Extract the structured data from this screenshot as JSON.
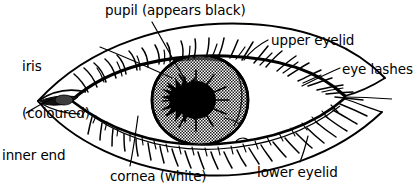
{
  "diagram": {
    "subject": "eye",
    "style": "line-drawing-with-halftone",
    "colors": {
      "ink": "#000000",
      "background": "#ffffff",
      "iris_fill": "#8a8a8a",
      "pupil_fill": "#000000",
      "sclera_fill": "#ffffff"
    },
    "labels": [
      {
        "id": "pupil",
        "text": "pupil (appears black)"
      },
      {
        "id": "iris",
        "line1": "iris",
        "line2": "(coloured)"
      },
      {
        "id": "upper",
        "text": "upper eyelid"
      },
      {
        "id": "lashes",
        "text": "eye lashes"
      },
      {
        "id": "inner",
        "line1": "inner end",
        "line2": "of eye"
      },
      {
        "id": "cornea",
        "text": "cornea (white)"
      },
      {
        "id": "lower",
        "text": "lower eyelid"
      }
    ],
    "parts": {
      "pupil": "pupil (appears black)",
      "iris_l1": "iris",
      "iris_l2": "(coloured)",
      "upper_eyelid": "upper eyelid",
      "eye_lashes": "eye lashes",
      "inner_end_l1": "inner end",
      "inner_end_l2": "of eye",
      "cornea": "cornea (white)",
      "lower_eyelid": "lower eyelid"
    }
  }
}
